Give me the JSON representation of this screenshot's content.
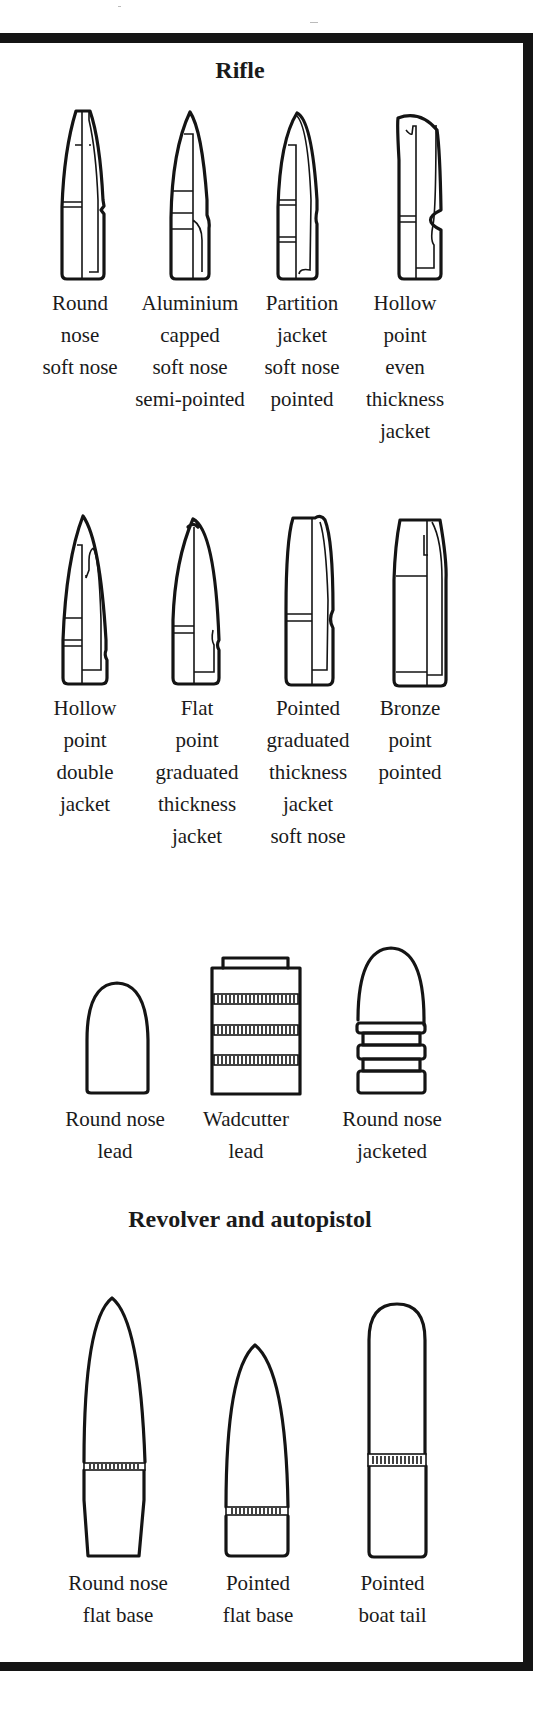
{
  "sections": {
    "rifle": {
      "title": "Rifle",
      "row1": [
        {
          "lines": [
            "Round",
            "nose",
            "soft nose"
          ],
          "icon": "round-nose-soft-nose-bullet"
        },
        {
          "lines": [
            "Aluminium",
            "capped",
            "soft nose",
            "semi-pointed"
          ],
          "icon": "aluminium-capped-bullet"
        },
        {
          "lines": [
            "Partition",
            "jacket",
            "soft nose",
            "pointed"
          ],
          "icon": "partition-jacket-bullet"
        },
        {
          "lines": [
            "Hollow",
            "point",
            "even",
            "thickness",
            "jacket"
          ],
          "icon": "hollow-point-even-jacket-bullet"
        }
      ],
      "row2": [
        {
          "lines": [
            "Hollow",
            "point",
            "double",
            "jacket"
          ],
          "icon": "hollow-point-double-jacket-bullet"
        },
        {
          "lines": [
            "Flat",
            "point",
            "graduated",
            "thickness",
            "jacket"
          ],
          "icon": "flat-point-graduated-bullet"
        },
        {
          "lines": [
            "Pointed",
            "graduated",
            "thickness",
            "jacket",
            "soft nose"
          ],
          "icon": "pointed-graduated-soft-nose-bullet"
        },
        {
          "lines": [
            "Bronze",
            "point",
            "pointed"
          ],
          "icon": "bronze-point-bullet"
        }
      ]
    },
    "lead": [
      {
        "lines": [
          "Round nose",
          "lead"
        ],
        "icon": "round-nose-lead-bullet"
      },
      {
        "lines": [
          "Wadcutter",
          "lead"
        ],
        "icon": "wadcutter-bullet"
      },
      {
        "lines": [
          "Round nose",
          "jacketed"
        ],
        "icon": "round-nose-jacketed-bullet"
      }
    ],
    "pistol": {
      "title": "Revolver and autopistol",
      "items": [
        {
          "lines": [
            "Round nose",
            "flat base"
          ],
          "icon": "round-nose-flat-base-bullet"
        },
        {
          "lines": [
            "Pointed",
            "flat base"
          ],
          "icon": "pointed-flat-base-bullet"
        },
        {
          "lines": [
            "Pointed",
            "boat tail"
          ],
          "icon": "pointed-boat-tail-bullet"
        }
      ]
    }
  },
  "colors": {
    "ink": "#141414",
    "paper": "#ffffff"
  }
}
